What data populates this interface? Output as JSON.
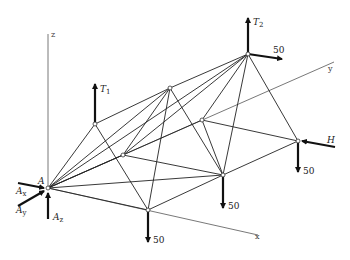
{
  "diagram": {
    "axes": {
      "x_label": "x",
      "y_label": "y",
      "z_label": "z"
    },
    "nodes": {
      "A": [
        48,
        188
      ],
      "B": [
        95,
        124
      ],
      "C": [
        170,
        88
      ],
      "D": [
        248,
        54
      ],
      "E": [
        123,
        155
      ],
      "F": [
        202,
        120
      ],
      "G": [
        148,
        210
      ],
      "K": [
        223,
        175
      ],
      "L": [
        298,
        141
      ]
    },
    "labels": {
      "A": "A",
      "Ax": "A",
      "Ax_sub": "x",
      "Ay": "A",
      "Ay_sub": "y",
      "Az": "A",
      "Az_sub": "z",
      "T1": "T",
      "T1_sub": "1",
      "T2": "T",
      "T2_sub": "2",
      "H": "H"
    },
    "loads": {
      "D_horizontal": "50",
      "G_down": "50",
      "K_down": "50",
      "L_down": "50"
    }
  }
}
